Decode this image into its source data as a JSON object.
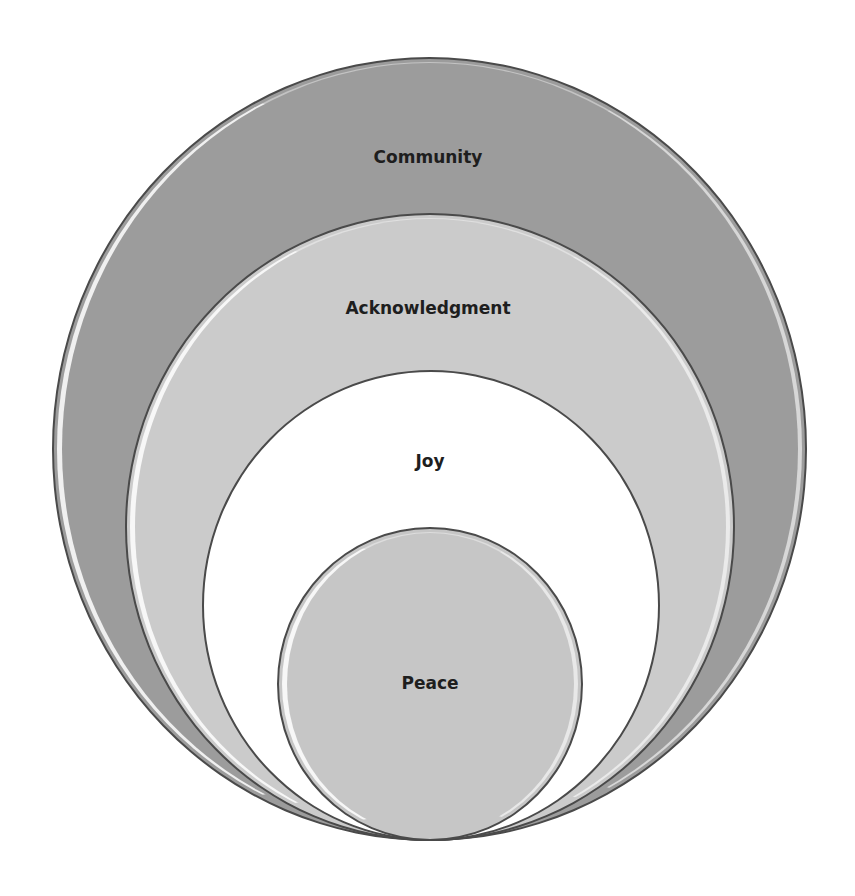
{
  "diagram": {
    "type": "nested-circles",
    "layers": [
      {
        "label": "Community",
        "fill": "#9c9c9c",
        "label_x": 428,
        "label_y": 157
      },
      {
        "label": "Acknowledgment",
        "fill": "#cbcbcb",
        "label_x": 428,
        "label_y": 308
      },
      {
        "label": "Joy",
        "fill": "#ffffff",
        "label_x": 430,
        "label_y": 461
      },
      {
        "label": "Peace",
        "fill": "#c6c6c6",
        "label_x": 430,
        "label_y": 683
      }
    ]
  }
}
